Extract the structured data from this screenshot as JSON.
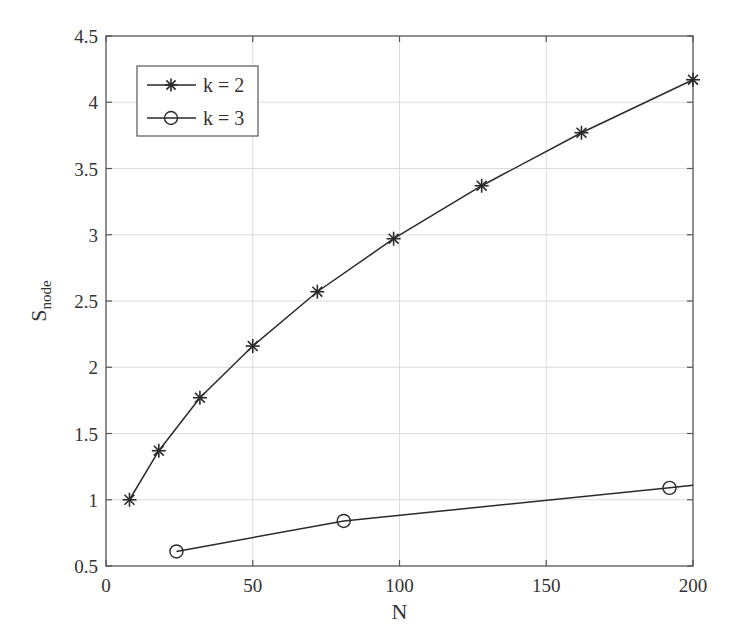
{
  "chart_data": {
    "type": "line",
    "title": "",
    "xlabel": "N",
    "ylabel": "S",
    "ylabel_subscript": "node",
    "xlim": [
      0,
      200
    ],
    "ylim": [
      0.5,
      4.5
    ],
    "xticks": [
      0,
      50,
      100,
      150,
      200
    ],
    "yticks": [
      0.5,
      1,
      1.5,
      2,
      2.5,
      3,
      3.5,
      4,
      4.5
    ],
    "xtick_labels": [
      "0",
      "50",
      "100",
      "150",
      "200"
    ],
    "ytick_labels": [
      "0.5",
      "1",
      "1.5",
      "2",
      "2.5",
      "3",
      "3.5",
      "4",
      "4.5"
    ],
    "grid": true,
    "legend_position": "upper left",
    "series": [
      {
        "name": "k = 2",
        "marker": "asterisk",
        "x": [
          8,
          18,
          32,
          50,
          72,
          98,
          128,
          162,
          200
        ],
        "y": [
          1.0,
          1.37,
          1.77,
          2.16,
          2.57,
          2.97,
          3.37,
          3.77,
          4.17
        ]
      },
      {
        "name": "k = 3",
        "marker": "circle",
        "x": [
          24,
          81,
          192
        ],
        "y": [
          0.61,
          0.84,
          1.09
        ],
        "line_extends_to_x": 200,
        "line_end_y": 1.11
      }
    ]
  },
  "colors": {
    "line": "#2a2a2a",
    "axis": "#555555",
    "grid": "#dcdcdc",
    "background": "#ffffff"
  }
}
